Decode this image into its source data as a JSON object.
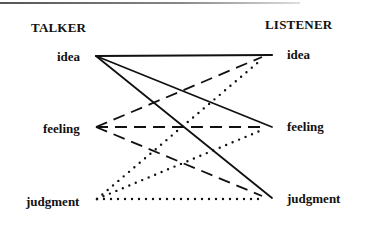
{
  "diagram": {
    "left_header": "TALKER",
    "right_header": "LISTENER",
    "talker_nodes": [
      {
        "id": "idea",
        "label": "idea"
      },
      {
        "id": "feeling",
        "label": "feeling"
      },
      {
        "id": "judgment",
        "label": "judgment"
      }
    ],
    "listener_nodes": [
      {
        "id": "idea",
        "label": "idea"
      },
      {
        "id": "feeling",
        "label": "feeling"
      },
      {
        "id": "judgment",
        "label": "judgment"
      }
    ],
    "edges": [
      {
        "from": "talker.idea",
        "to": "listener.idea",
        "style": "solid"
      },
      {
        "from": "talker.idea",
        "to": "listener.feeling",
        "style": "solid"
      },
      {
        "from": "talker.idea",
        "to": "listener.judgment",
        "style": "solid"
      },
      {
        "from": "talker.feeling",
        "to": "listener.idea",
        "style": "dashed"
      },
      {
        "from": "talker.feeling",
        "to": "listener.feeling",
        "style": "dashed"
      },
      {
        "from": "talker.feeling",
        "to": "listener.judgment",
        "style": "dashed"
      },
      {
        "from": "talker.judgment",
        "to": "listener.idea",
        "style": "dotted"
      },
      {
        "from": "talker.judgment",
        "to": "listener.feeling",
        "style": "dotted"
      },
      {
        "from": "talker.judgment",
        "to": "listener.judgment",
        "style": "dotted"
      }
    ],
    "line_color": "#111111"
  }
}
